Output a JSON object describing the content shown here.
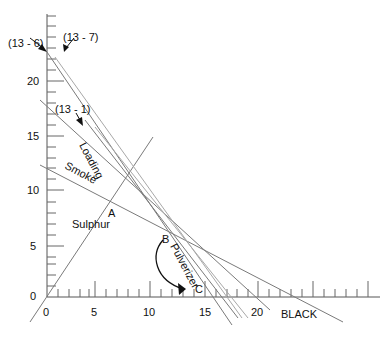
{
  "diagram": {
    "axis": {
      "x_ticks": [
        {
          "value": "0",
          "x": 47
        },
        {
          "value": "5",
          "x": 95
        },
        {
          "value": "10",
          "x": 150
        },
        {
          "value": "15",
          "x": 205
        },
        {
          "value": "20",
          "x": 258
        }
      ],
      "y_ticks": [
        {
          "value": "0",
          "y": 297
        },
        {
          "value": "5",
          "y": 246
        },
        {
          "value": "10",
          "y": 190
        },
        {
          "value": "15",
          "y": 136
        },
        {
          "value": "20",
          "y": 81
        }
      ],
      "x_label": "BLACK"
    },
    "labels": {
      "eq_13_6": "(13 - 6)",
      "eq_13_7": "(13 - 7)",
      "eq_13_1": "(13 - 1)",
      "loading": "Loading",
      "smoke": "Smoke",
      "sulphur": "Sulphur",
      "pulverizer": "Pulverizer",
      "point_a": "A",
      "point_b": "B",
      "point_c": "C"
    }
  }
}
